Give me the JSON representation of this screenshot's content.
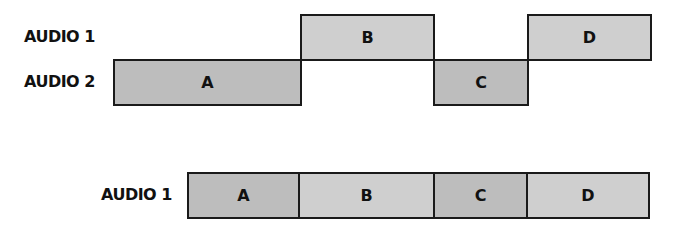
{
  "top_diagram": {
    "tracks": [
      {
        "label": "AUDIO 1"
      },
      {
        "label": "AUDIO 2"
      }
    ],
    "clips": [
      {
        "name": "A",
        "track": "AUDIO 2",
        "shade": "dark"
      },
      {
        "name": "B",
        "track": "AUDIO 1",
        "shade": "light"
      },
      {
        "name": "C",
        "track": "AUDIO 2",
        "shade": "dark"
      },
      {
        "name": "D",
        "track": "AUDIO 1",
        "shade": "light"
      }
    ]
  },
  "bottom_diagram": {
    "track_label": "AUDIO 1",
    "segments": [
      {
        "name": "A",
        "shade": "dark"
      },
      {
        "name": "B",
        "shade": "light"
      },
      {
        "name": "C",
        "shade": "dark"
      },
      {
        "name": "D",
        "shade": "light"
      }
    ]
  },
  "colors": {
    "dark_clip": "#bdbdbd",
    "light_clip": "#cfcfcf",
    "border": "#1a1a1a"
  }
}
